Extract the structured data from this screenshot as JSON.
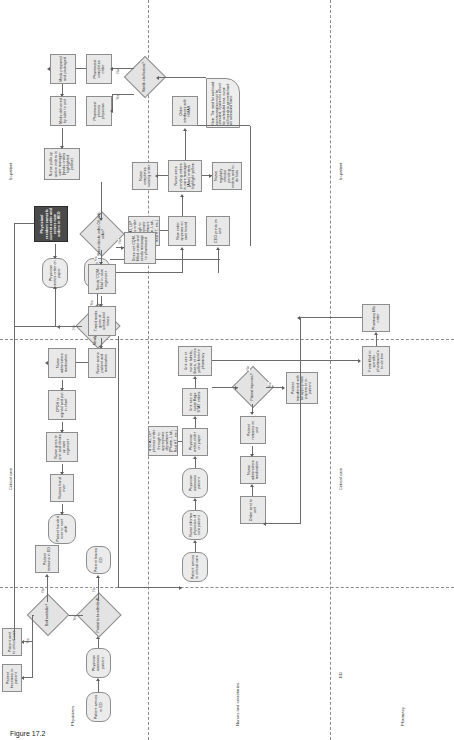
{
  "figure": {
    "caption": "Figure 17.2"
  },
  "lanes": [
    {
      "id": "physicians",
      "label": "Physicians"
    },
    {
      "id": "nurses",
      "label": "Nurses and secretaries"
    },
    {
      "id": "pharmacy",
      "label": "Pharmacy"
    }
  ],
  "zones": [
    {
      "id": "ed",
      "label": "ED"
    },
    {
      "id": "critical",
      "label": "Critical care"
    },
    {
      "id": "inpatient",
      "label": "In-patient"
    },
    {
      "id": "ed2",
      "label": "ED"
    },
    {
      "id": "critical2",
      "label": "Critical care"
    },
    {
      "id": "inpatient2",
      "label": "In-patient"
    }
  ],
  "nodes": {
    "patient_arrives_ed": "Patient arrives in ED",
    "physician_assesses": "Physician assesses patient",
    "to_be_admitted": "Patient to be admitted?",
    "patient_leaves_ed": "Patient leaves ED",
    "bed_available": "Bed available?",
    "patient_remains_ed": "Patient remains in ED",
    "patient_becomes_inpatient": "Patient becomes in-patient",
    "patient_sent_critical": "Patient sent to critical care",
    "patient_arrives_critical": "Patient arrives in critical care",
    "nurse_informs_physician": "Nurse informs physician of new patient",
    "physician_assesses_patient2": "Physician assesses patient",
    "stat_lip_phones": "If STAT, LIP phones order through to appropriate department (Pharm, Lab, Rad HT, etc.)",
    "physician_writes_paper": "Physician writes order on paper",
    "unit_sec_flags_stat": "Unit sec or nurse flags STAT orders",
    "unit_sec_labels_faxes": "Unit sec or nurse labels, faxes, or notes yellow form to pharmacy",
    "form_filed": "Form filed to specific pharmacist's to-do box",
    "pharmacy_fills_order": "Pharmacy fills order",
    "patient_improves": "Patient improves?",
    "patient_transferred": "Patient transferred with all appropriate papers to in-patient",
    "patient_remains_unit": "Patient remains on unit",
    "nurse_administers_med2": "Nurse administers medication",
    "order_sent_unit": "Order sent to unit",
    "newly_admitted_heo": "Newly admitted patient in HEO?",
    "physician_enters_heo": "Physician enters order in HEO",
    "physician_writes_paper2": "Physician writes order on paper",
    "cpoe_prints_unit": "CEO prints on unit",
    "new_order_care_board": "New order appears on care board",
    "stat_lip_phones2": "If STAT, LIP phones order through to appropriate department (Pharm, Lab, Rad HT, etc.)",
    "nurse_sees_pending": "Nurse sees pending orders in care manager (Alan) orders highlight yellow",
    "nurse_completes_order": "Nurse completes nursing order",
    "nurse_regularly_checks": "Nurse regularly checks pending orders and to-do lists",
    "order_interfaces_hmar": "Order interfaces with HMAR",
    "note_box": "Note: The need for continued communication must be stressed; if patient is off unit for scheduled time, nurse still needs to get meds back on scheduled times.",
    "physician_cancels_dark": "Physician/ resident cancels current order and enters new orders in HEO",
    "nurse_pulls_up_active": "Nurse pulls up active orders in care manager (meds orders highlighted yellow)",
    "meds_delivered_tube": "Meds delivered by tube to unit",
    "pharmacist_phones": "Pharmacist phones physician",
    "pharmacist_completes": "Pharmacist completes order",
    "needs_clarification": "Needs clarification?",
    "meds_prepared_packaged": "Meds prepared and packaged",
    "sends_cpoe_order": "Sends 'CQM-filial' in care organizer",
    "nurse_checks_order_ok": "Nurse checks order, OK with order?",
    "does_not_cpoe_filled": "Does not CQM-filled order and sends message to pharmacist",
    "timed_meds_scheduled": "Timed meds given at scheduled times",
    "nurse_scans_patient": "Nurse scans patient and medication",
    "nurse_administers_med": "Nurse administers medication",
    "cpoe_signed_chart": "CPOH is signed and put in chart",
    "nurse_goes_unit_clocks": "Nurse goes to unit and clocks up care organizer",
    "nurses_hand_over": "Nurses hand over",
    "patient_handed_over": "Patient handed over to next shift"
  },
  "edge_labels": {
    "yes": "Yes",
    "no": "No"
  },
  "colors": {
    "node_fill": "#e8e8e8",
    "node_border": "#8d8d8d",
    "dark_fill": "#4a4a4a",
    "line": "#6b6b6b"
  }
}
